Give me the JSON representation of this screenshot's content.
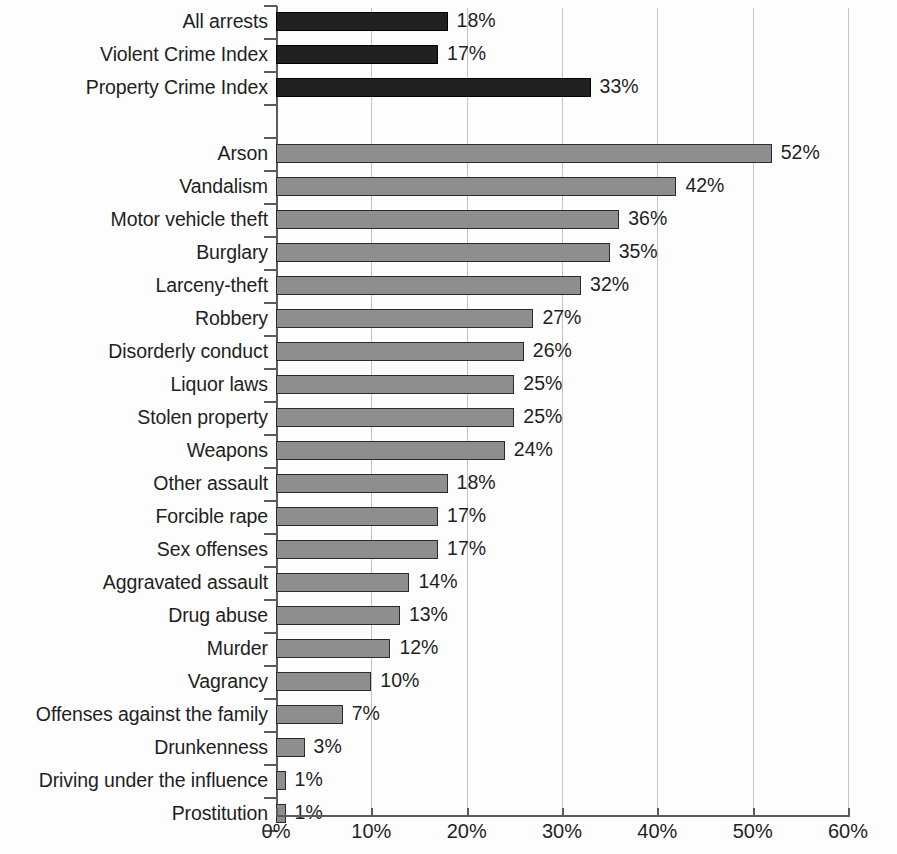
{
  "chart_data": {
    "type": "bar",
    "orientation": "horizontal",
    "title": "",
    "subtitle": "",
    "xlabel": "",
    "ylabel": "",
    "xlim": [
      0,
      60
    ],
    "grid": true,
    "legend": null,
    "value_suffix": "%",
    "x_ticks": [
      {
        "value": 0,
        "label": "0%"
      },
      {
        "value": 10,
        "label": "10%"
      },
      {
        "value": 20,
        "label": "20%"
      },
      {
        "value": 30,
        "label": "30%"
      },
      {
        "value": 40,
        "label": "40%"
      },
      {
        "value": 50,
        "label": "50%"
      },
      {
        "value": 60,
        "label": "60%"
      }
    ],
    "series": [
      {
        "name": "summary-totals",
        "style": "dark",
        "color": "#212121",
        "points": [
          {
            "category": "All arrests",
            "value": 18,
            "label": "18%"
          },
          {
            "category": "Violent Crime Index",
            "value": 17,
            "label": "17%"
          },
          {
            "category": "Property Crime Index",
            "value": 33,
            "label": "33%"
          }
        ]
      },
      {
        "name": "offense-breakdown",
        "style": "light",
        "color": "#8e8e8e",
        "points": [
          {
            "category": "Arson",
            "value": 52,
            "label": "52%"
          },
          {
            "category": "Vandalism",
            "value": 42,
            "label": "42%"
          },
          {
            "category": "Motor vehicle theft",
            "value": 36,
            "label": "36%"
          },
          {
            "category": "Burglary",
            "value": 35,
            "label": "35%"
          },
          {
            "category": "Larceny-theft",
            "value": 32,
            "label": "32%"
          },
          {
            "category": "Robbery",
            "value": 27,
            "label": "27%"
          },
          {
            "category": "Disorderly conduct",
            "value": 26,
            "label": "26%"
          },
          {
            "category": "Liquor laws",
            "value": 25,
            "label": "25%"
          },
          {
            "category": "Stolen property",
            "value": 25,
            "label": "25%"
          },
          {
            "category": "Weapons",
            "value": 24,
            "label": "24%"
          },
          {
            "category": "Other assault",
            "value": 18,
            "label": "18%"
          },
          {
            "category": "Forcible rape",
            "value": 17,
            "label": "17%"
          },
          {
            "category": "Sex offenses",
            "value": 17,
            "label": "17%"
          },
          {
            "category": "Aggravated assault",
            "value": 14,
            "label": "14%"
          },
          {
            "category": "Drug abuse",
            "value": 13,
            "label": "13%"
          },
          {
            "category": "Murder",
            "value": 12,
            "label": "12%"
          },
          {
            "category": "Vagrancy",
            "value": 10,
            "label": "10%"
          },
          {
            "category": "Offenses against the family",
            "value": 7,
            "label": "7%"
          },
          {
            "category": "Drunkenness",
            "value": 3,
            "label": "3%"
          },
          {
            "category": "Driving under the influence",
            "value": 1,
            "label": "1%"
          },
          {
            "category": "Prostitution",
            "value": 1,
            "label": "1%"
          }
        ]
      }
    ]
  },
  "colors": {
    "dark_bar": "#212121",
    "light_bar": "#8e8e8e",
    "bar_outline": "#2b2b2b",
    "gridline": "#c2c2c2",
    "axis": "#5b5b5b",
    "text": "#1f1f1f",
    "background": "#fdfdfd"
  }
}
